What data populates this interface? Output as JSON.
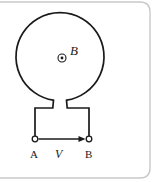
{
  "figure": {
    "kind": "physics-circuit-diagram",
    "frame_color": "#c8c8c8",
    "stroke_color": "#1a1a1a",
    "background_color": "#ffffff"
  },
  "loop": {
    "name": "circular-loop",
    "center_x": 60,
    "center_y": 57,
    "radius": 44,
    "stroke_width": 1.6
  },
  "field_symbol": {
    "name": "field-out-of-page",
    "center_x": 62,
    "center_y": 58,
    "outer_radius": 4,
    "dot_radius": 1.4,
    "label": "B"
  },
  "terminals": [
    {
      "name": "terminal-a",
      "label": "A",
      "center_x": 35,
      "center_y": 139,
      "radius": 2.8
    },
    {
      "name": "terminal-b",
      "label": "B",
      "center_x": 89,
      "center_y": 139,
      "radius": 2.8
    }
  ],
  "voltage_arrow": {
    "name": "voltage-arrow",
    "label": "V",
    "from_x": 39,
    "from_y": 139,
    "to_x": 85,
    "to_y": 139
  },
  "labels": {
    "field": "B",
    "voltage": "V",
    "terminal_a": "A",
    "terminal_b": "B"
  }
}
